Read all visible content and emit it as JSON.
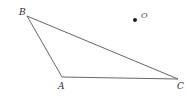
{
  "figure": {
    "type": "geometry-diagram",
    "background_color": "#ffffff",
    "stroke_color": "#55555b",
    "stroke_width": 0.9,
    "width": 191,
    "height": 99
  },
  "shapes": {
    "triangle": {
      "name": "triangle-ABC",
      "vertices": [
        {
          "label": "B",
          "x": 27,
          "y": 16
        },
        {
          "label": "C",
          "x": 178,
          "y": 79
        },
        {
          "label": "A",
          "x": 62,
          "y": 77
        }
      ],
      "edges": [
        {
          "name": "edge-BC",
          "from": "B",
          "to": "C"
        },
        {
          "name": "edge-CA",
          "from": "C",
          "to": "A"
        },
        {
          "name": "edge-AB",
          "from": "A",
          "to": "B"
        }
      ]
    },
    "point_O": {
      "name": "point-O",
      "label": "O",
      "x": 135,
      "y": 20,
      "radius": 2,
      "fill": "#1f1f1f"
    }
  },
  "labels": {
    "B": "B",
    "A": "A",
    "C": "C",
    "O": "O"
  }
}
